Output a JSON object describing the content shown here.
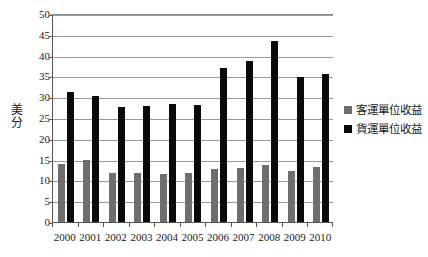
{
  "chart_data": {
    "type": "bar",
    "title": "",
    "subtitle": "",
    "xlabel": "",
    "ylabel": "美分",
    "ylabel_chars": [
      "美",
      "分"
    ],
    "categories": [
      "2000",
      "2001",
      "2002",
      "2003",
      "2004",
      "2005",
      "2006",
      "2007",
      "2008",
      "2009",
      "2010"
    ],
    "series": [
      {
        "name": "客運單位收益",
        "color": "#6e6e6e",
        "values": [
          14.0,
          15.0,
          11.8,
          11.9,
          11.5,
          11.9,
          12.7,
          13.0,
          13.8,
          12.2,
          13.2
        ]
      },
      {
        "name": "貨運單位收益",
        "color": "#0a0a0a",
        "values": [
          31.3,
          30.2,
          27.7,
          27.8,
          28.3,
          28.1,
          37.1,
          38.8,
          43.5,
          34.9,
          35.6
        ]
      }
    ],
    "ylim": [
      0,
      50
    ],
    "ytick_step": 5,
    "yticks": [
      "0",
      "5",
      "10",
      "15",
      "20",
      "25",
      "30",
      "35",
      "40",
      "45",
      "50"
    ],
    "grid": true,
    "grid_axis": "y",
    "legend_position": "right"
  }
}
